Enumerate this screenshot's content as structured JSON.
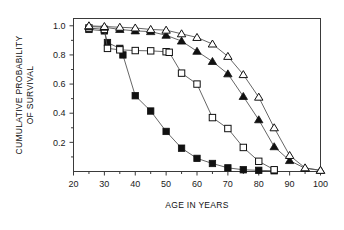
{
  "figure": {
    "title": "",
    "background_color": "#ffffff"
  },
  "axes": {
    "x_title": "AGE IN YEARS",
    "y_title_line1": "CUMULATIVE PROBABILITY",
    "y_title_line2": "OF SURVIVAL",
    "x_ticks": [
      "20",
      "30",
      "40",
      "50",
      "60",
      "70",
      "80",
      "90",
      "100"
    ],
    "y_ticks": [
      "0.2",
      "0.4",
      "0.6",
      "0.8",
      "1.0"
    ]
  },
  "chart_data": {
    "type": "line",
    "title": "",
    "xlabel": "AGE IN YEARS",
    "ylabel": "CUMULATIVE PROBABILITY OF SURVIVAL",
    "xlim": [
      20,
      100
    ],
    "ylim": [
      0.0,
      1.05
    ],
    "x_ticks": [
      20,
      30,
      40,
      50,
      60,
      70,
      80,
      90,
      100
    ],
    "x_minor_ticks": [
      25,
      35,
      45,
      55,
      65,
      75,
      85,
      95
    ],
    "y_ticks": [
      0.2,
      0.4,
      0.6,
      0.8,
      1.0
    ],
    "y_minor_ticks": [
      0.1,
      0.3,
      0.5,
      0.7,
      0.9
    ],
    "grid": false,
    "legend": "none",
    "marker_colors": {
      "filled": "#111111",
      "open_fill": "#ffffff",
      "open_stroke": "#111111",
      "line": "#555555"
    },
    "series": [
      {
        "name": "filled-square",
        "marker": "square",
        "filled": true,
        "x": [
          25,
          30,
          31,
          35,
          36,
          40,
          45,
          50,
          55,
          60,
          65,
          70,
          75,
          80,
          85
        ],
        "values": [
          0.975,
          0.965,
          0.885,
          0.845,
          0.8,
          0.52,
          0.415,
          0.275,
          0.16,
          0.09,
          0.055,
          0.025,
          0.012,
          0.008,
          0.005
        ]
      },
      {
        "name": "open-square",
        "marker": "square",
        "filled": false,
        "x": [
          25,
          30,
          31,
          35,
          40,
          45,
          50,
          51,
          55,
          60,
          65,
          70,
          75,
          80,
          85
        ],
        "values": [
          0.985,
          0.975,
          0.845,
          0.835,
          0.83,
          0.828,
          0.822,
          0.818,
          0.675,
          0.6,
          0.37,
          0.295,
          0.165,
          0.07,
          0.012
        ]
      },
      {
        "name": "filled-triangle",
        "marker": "triangle",
        "filled": true,
        "x": [
          25,
          30,
          35,
          40,
          45,
          50,
          55,
          60,
          65,
          70,
          75,
          80,
          85,
          90,
          95,
          100
        ],
        "values": [
          0.995,
          0.99,
          0.975,
          0.965,
          0.96,
          0.935,
          0.895,
          0.825,
          0.755,
          0.67,
          0.515,
          0.355,
          0.17,
          0.075,
          0.022,
          0.008
        ]
      },
      {
        "name": "open-triangle",
        "marker": "triangle",
        "filled": false,
        "x": [
          25,
          30,
          35,
          40,
          45,
          50,
          55,
          60,
          65,
          70,
          75,
          80,
          85,
          90,
          95,
          100
        ],
        "values": [
          1.0,
          0.995,
          0.99,
          0.985,
          0.975,
          0.97,
          0.945,
          0.92,
          0.875,
          0.79,
          0.665,
          0.51,
          0.3,
          0.11,
          0.025,
          0.008
        ]
      }
    ]
  }
}
